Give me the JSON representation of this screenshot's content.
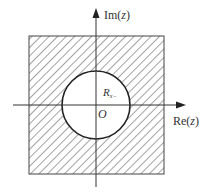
{
  "diagram": {
    "type": "z-plane region of convergence",
    "axes": {
      "horizontal_label_prefix": "Re(",
      "horizontal_label_var": "z",
      "horizontal_label_suffix": ")",
      "vertical_label_prefix": "Im(",
      "vertical_label_var": "z",
      "vertical_label_suffix": ")"
    },
    "origin_label": "O",
    "radius_label": "R",
    "radius_subscript": "x−",
    "shaded_region": "outside circle of radius R_x− (hatched), inside square",
    "colors": {
      "line": "#333333",
      "hatch": "#555555",
      "background": "#ffffff"
    }
  }
}
